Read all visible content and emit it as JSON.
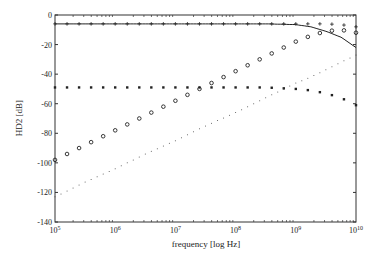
{
  "chart_data": {
    "type": "line",
    "title": "",
    "xlabel": "frequency [log Hz]",
    "ylabel": "HD2 [dB]",
    "xscale": "log",
    "xlim": [
      100000,
      10000000000
    ],
    "ylim": [
      -140,
      0
    ],
    "xticks": [
      "10^5",
      "10^6",
      "10^7",
      "10^8",
      "10^9",
      "10^10"
    ],
    "yticks": [
      0,
      -20,
      -40,
      -60,
      -80,
      -100,
      -120,
      -140
    ],
    "grid": false,
    "legend": null,
    "x": [
      5,
      5.5,
      6,
      6.5,
      7,
      7.5,
      8,
      8.5,
      9,
      9.25,
      9.5,
      9.75,
      10
    ],
    "series": [
      {
        "name": "solid",
        "marker": "line",
        "values": [
          -6,
          -6,
          -6,
          -6,
          -6,
          -6,
          -6,
          -6,
          -6.5,
          -8,
          -11,
          -15,
          -22
        ]
      },
      {
        "name": "plus",
        "marker": "+",
        "values": [
          -6,
          -6,
          -6,
          -6,
          -6,
          -6,
          -6,
          -6,
          -6,
          -6,
          -6,
          -6.5,
          -8
        ]
      },
      {
        "name": "circle",
        "marker": "o",
        "values": [
          -98,
          -88,
          -78,
          -68,
          -58,
          -48,
          -38,
          -28,
          -18,
          -14,
          -11,
          -10,
          -12
        ]
      },
      {
        "name": "square",
        "marker": "s",
        "values": [
          -49,
          -49,
          -49,
          -49,
          -49,
          -49,
          -49,
          -49,
          -50,
          -51,
          -53,
          -56,
          -61
        ]
      },
      {
        "name": "dotted",
        "marker": ".",
        "values": [
          -123,
          -113,
          -104,
          -94,
          -85,
          -75,
          -66,
          -56,
          -46,
          -42,
          -37,
          -32,
          -27
        ]
      }
    ]
  }
}
